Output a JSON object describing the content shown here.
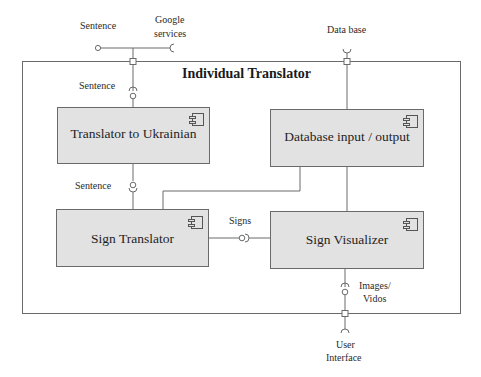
{
  "diagram": {
    "type": "UML component diagram",
    "title": "Individual Translator",
    "components": [
      {
        "id": "translator_ukrainian",
        "label": "Translator to Ukrainian"
      },
      {
        "id": "database_io",
        "label": "Database input / output"
      },
      {
        "id": "sign_translator",
        "label": "Sign Translator"
      },
      {
        "id": "sign_visualizer",
        "label": "Sign Visualizer"
      }
    ],
    "external_labels": {
      "sentence_external": "Sentence",
      "google_services_line1": "Google",
      "google_services_line2": "services",
      "data_base": "Data base",
      "user_interface_line1": "User",
      "user_interface_line2": "Interface"
    },
    "interface_labels": {
      "sentence_in": "Sentence",
      "sentence_mid": "Sentence",
      "signs": "Signs",
      "images_videos_line1": "Images/",
      "images_videos_line2": "Vidos"
    },
    "connections": [
      {
        "from": "Sentence (provided)",
        "to": "port-top",
        "interface": "Sentence"
      },
      {
        "from": "Google services (required)",
        "to": "port-top",
        "interface": "Google services"
      },
      {
        "from": "port-top",
        "to": "Translator to Ukrainian",
        "interface": "Sentence"
      },
      {
        "from": "Translator to Ukrainian",
        "to": "Sign Translator",
        "interface": "Sentence"
      },
      {
        "from": "Sign Translator",
        "to": "Sign Visualizer",
        "interface": "Signs"
      },
      {
        "from": "Sign Translator",
        "to": "Database input / output",
        "interface": ""
      },
      {
        "from": "Data base (required)",
        "to": "Database input / output",
        "interface": "Data base"
      },
      {
        "from": "Database input / output",
        "to": "Sign Visualizer",
        "interface": ""
      },
      {
        "from": "Sign Visualizer",
        "to": "User Interface",
        "interface": "Images/Vidos"
      }
    ],
    "colors": {
      "component_fill": "#e2e2e2",
      "line": "#6a6a6a",
      "background": "#ffffff"
    }
  }
}
